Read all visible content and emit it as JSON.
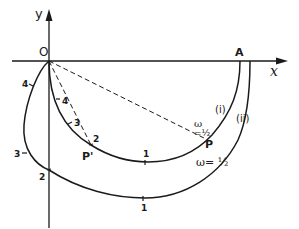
{
  "axes": {
    "x_label": "x",
    "y_label": "y",
    "origin_label": "O",
    "end_point_label": "A"
  },
  "curves": [
    {
      "id": "i",
      "label": "(i)",
      "marks": [
        "4",
        "3",
        "2",
        "1"
      ],
      "point_label": "P'",
      "annotation_omega": "ω",
      "annotation_value": "=½"
    },
    {
      "id": "ii",
      "label": "(ii)",
      "marks": [
        "4",
        "3",
        "2",
        "1"
      ],
      "annotation": "ω= ½"
    }
  ],
  "points": {
    "p_prime": "P'",
    "p": "P"
  },
  "colors": {
    "ink": "#1a1a1a",
    "background": "#ffffff"
  }
}
